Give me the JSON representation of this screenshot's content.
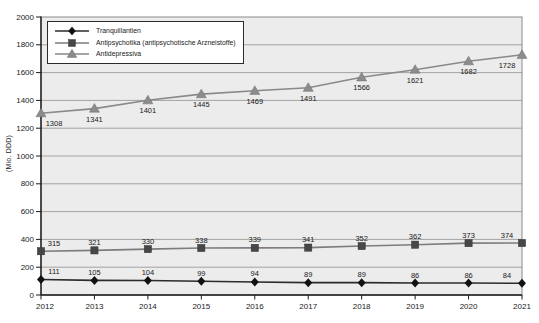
{
  "chart_data": {
    "type": "line",
    "title": "",
    "xlabel": "",
    "ylabel": "(Mio. DDD)",
    "ylim": [
      0,
      2000
    ],
    "ytick_step": 200,
    "grid": true,
    "legend_position": "top-left",
    "categories": [
      "2012",
      "2013",
      "2014",
      "2015",
      "2016",
      "2017",
      "2018",
      "2019",
      "2020",
      "2021"
    ],
    "series": [
      {
        "name": "Tranquillantien",
        "marker": "diamond",
        "marker_color": "#111111",
        "line_color": "#2b2b2b",
        "label_position": "above",
        "values": [
          111,
          105,
          104,
          99,
          94,
          89,
          89,
          86,
          86,
          84
        ]
      },
      {
        "name": "Antipsychotika (antipsychotische Arzneistoffe)",
        "marker": "square",
        "marker_color": "#474747",
        "line_color": "#7c7c7c",
        "label_position": "above",
        "values": [
          315,
          321,
          330,
          338,
          339,
          341,
          352,
          362,
          373,
          374
        ]
      },
      {
        "name": "Antidepressiva",
        "marker": "triangle",
        "marker_color": "#8c8c8c",
        "line_color": "#898989",
        "label_position": "below",
        "values": [
          1308,
          1341,
          1401,
          1445,
          1469,
          1491,
          1566,
          1621,
          1682,
          1728
        ]
      }
    ]
  },
  "colors": {
    "plot_background": "#ececec",
    "gridline": "#a3a3a3",
    "frame": "#8a8a8a",
    "axis": "#1a1a1a",
    "tick_label": "#1a1a1a",
    "data_label": "#1a1a1a"
  }
}
